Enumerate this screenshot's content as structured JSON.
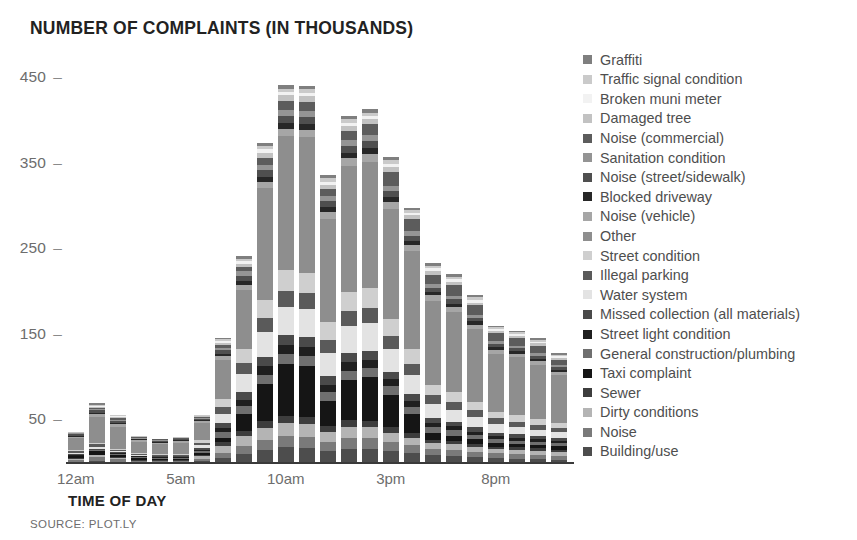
{
  "chart_data": {
    "type": "bar",
    "barmode": "stacked",
    "title": "NUMBER OF COMPLAINTS (IN THOUSANDS)",
    "xlabel": "TIME OF DAY",
    "ylabel": "",
    "source": "SOURCE: PLOT.LY",
    "ylim": [
      0,
      470
    ],
    "ytick_values": [
      50,
      150,
      250,
      350,
      450
    ],
    "ytick_labels": [
      "50",
      "150",
      "250",
      "350",
      "450"
    ],
    "xtick_labels": [
      "12am",
      "5am",
      "10am",
      "3pm",
      "8pm"
    ],
    "xtick_indices": [
      0,
      5,
      10,
      15,
      20
    ],
    "grid": false,
    "legend_position": "right",
    "categories": [
      "12am",
      "1am",
      "2am",
      "3am",
      "4am",
      "5am",
      "6am",
      "7am",
      "8am",
      "9am",
      "10am",
      "11am",
      "12pm",
      "1pm",
      "2pm",
      "3pm",
      "4pm",
      "5pm",
      "6pm",
      "7pm",
      "8pm",
      "9pm",
      "10pm",
      "11pm"
    ],
    "totals": [
      38,
      72,
      58,
      33,
      30,
      32,
      57,
      148,
      243,
      376,
      443,
      442,
      338,
      407,
      415,
      359,
      300,
      235,
      222,
      198,
      162,
      156,
      147,
      130
    ],
    "series": [
      {
        "name": "Building/use",
        "color": "#4d4d4d",
        "values": [
          2,
          3,
          2,
          1,
          1,
          1,
          3,
          7,
          12,
          17,
          20,
          19,
          15,
          18,
          18,
          16,
          13,
          10,
          9,
          8,
          7,
          6,
          6,
          5
        ]
      },
      {
        "name": "Noise",
        "color": "#7a7a7a",
        "values": [
          3,
          5,
          4,
          2,
          2,
          2,
          3,
          6,
          9,
          12,
          14,
          14,
          11,
          13,
          13,
          11,
          9,
          7,
          7,
          6,
          6,
          6,
          5,
          5
        ]
      },
      {
        "name": "Dirty conditions",
        "color": "#b4b4b4",
        "values": [
          1,
          2,
          1,
          1,
          1,
          1,
          3,
          8,
          12,
          14,
          15,
          15,
          12,
          13,
          13,
          11,
          9,
          7,
          7,
          6,
          5,
          5,
          5,
          4
        ]
      },
      {
        "name": "Sewer",
        "color": "#3d3d3d",
        "values": [
          1,
          1,
          1,
          1,
          1,
          1,
          2,
          5,
          7,
          8,
          9,
          9,
          7,
          8,
          8,
          7,
          6,
          4,
          4,
          4,
          3,
          3,
          3,
          3
        ]
      },
      {
        "name": "Taxi complaint",
        "color": "#151515",
        "values": [
          2,
          4,
          3,
          2,
          1,
          1,
          2,
          5,
          20,
          45,
          63,
          62,
          30,
          48,
          52,
          40,
          22,
          8,
          6,
          5,
          4,
          4,
          4,
          4
        ]
      },
      {
        "name": "General construction/plumbing",
        "color": "#6f6f6f",
        "values": [
          1,
          1,
          1,
          1,
          1,
          1,
          2,
          6,
          9,
          11,
          12,
          12,
          10,
          11,
          11,
          10,
          8,
          6,
          6,
          5,
          5,
          4,
          4,
          4
        ]
      },
      {
        "name": "Street light condition",
        "color": "#1f1f1f",
        "values": [
          1,
          1,
          1,
          1,
          1,
          1,
          2,
          5,
          8,
          10,
          11,
          11,
          9,
          10,
          10,
          9,
          7,
          5,
          5,
          4,
          4,
          4,
          3,
          3
        ]
      },
      {
        "name": "Missed collection (all materials)",
        "color": "#4a4a4a",
        "values": [
          1,
          1,
          1,
          1,
          1,
          1,
          2,
          6,
          9,
          11,
          12,
          12,
          10,
          11,
          11,
          9,
          8,
          6,
          5,
          5,
          4,
          4,
          4,
          3
        ]
      },
      {
        "name": "Water system",
        "color": "#e3e3e3",
        "values": [
          1,
          2,
          1,
          1,
          1,
          1,
          3,
          11,
          22,
          30,
          34,
          34,
          28,
          32,
          33,
          28,
          23,
          16,
          14,
          12,
          10,
          9,
          8,
          7
        ]
      },
      {
        "name": "Illegal parking",
        "color": "#5a5a5a",
        "values": [
          2,
          3,
          2,
          1,
          1,
          1,
          3,
          8,
          13,
          17,
          19,
          19,
          15,
          18,
          18,
          16,
          13,
          10,
          9,
          8,
          7,
          6,
          6,
          5
        ]
      },
      {
        "name": "Street condition",
        "color": "#cfcfcf",
        "values": [
          1,
          2,
          1,
          1,
          1,
          1,
          3,
          9,
          16,
          22,
          25,
          25,
          21,
          23,
          24,
          21,
          17,
          12,
          11,
          10,
          8,
          8,
          7,
          6
        ]
      },
      {
        "name": "Other",
        "color": "#8e8e8e",
        "values": [
          14,
          30,
          26,
          13,
          11,
          13,
          20,
          46,
          71,
          133,
          162,
          164,
          122,
          150,
          152,
          135,
          116,
          96,
          93,
          85,
          70,
          70,
          66,
          57
        ]
      },
      {
        "name": "Noise (vehicle)",
        "color": "#a6a6a6",
        "values": [
          2,
          4,
          3,
          2,
          2,
          2,
          2,
          4,
          6,
          8,
          9,
          9,
          8,
          9,
          9,
          8,
          7,
          6,
          6,
          5,
          5,
          4,
          4,
          4
        ]
      },
      {
        "name": "Blocked driveway",
        "color": "#272727",
        "values": [
          1,
          1,
          1,
          1,
          1,
          1,
          1,
          3,
          5,
          6,
          7,
          7,
          6,
          6,
          7,
          6,
          5,
          4,
          4,
          4,
          3,
          3,
          3,
          3
        ]
      },
      {
        "name": "Noise (street/sidewalk)",
        "color": "#4f4f4f",
        "values": [
          2,
          3,
          3,
          1,
          1,
          1,
          2,
          4,
          6,
          8,
          9,
          9,
          7,
          8,
          9,
          8,
          6,
          5,
          5,
          4,
          4,
          4,
          4,
          3
        ]
      },
      {
        "name": "Sanitation condition",
        "color": "#949494",
        "values": [
          1,
          1,
          1,
          1,
          1,
          1,
          1,
          3,
          5,
          6,
          7,
          7,
          6,
          7,
          7,
          6,
          5,
          4,
          4,
          4,
          3,
          3,
          3,
          3
        ]
      },
      {
        "name": "Noise (commercial)",
        "color": "#5c5c5c",
        "values": [
          1,
          2,
          2,
          1,
          1,
          1,
          1,
          3,
          5,
          9,
          11,
          11,
          8,
          11,
          13,
          17,
          14,
          11,
          12,
          11,
          10,
          9,
          9,
          6
        ]
      },
      {
        "name": "Damaged tree",
        "color": "#c2c2c2",
        "values": [
          1,
          1,
          1,
          1,
          1,
          1,
          1,
          3,
          4,
          6,
          7,
          7,
          5,
          6,
          6,
          6,
          5,
          4,
          4,
          3,
          3,
          3,
          3,
          2
        ]
      },
      {
        "name": "Broken muni meter",
        "color": "#f2f2f2",
        "values": [
          0,
          1,
          1,
          0,
          0,
          0,
          0,
          2,
          3,
          4,
          4,
          4,
          4,
          4,
          4,
          4,
          3,
          3,
          3,
          3,
          2,
          2,
          2,
          2
        ]
      },
      {
        "name": "Traffic signal condition",
        "color": "#cacaca",
        "values": [
          0,
          1,
          1,
          0,
          0,
          0,
          1,
          2,
          3,
          4,
          4,
          4,
          4,
          4,
          4,
          4,
          3,
          3,
          3,
          3,
          2,
          2,
          2,
          2
        ]
      },
      {
        "name": "Graffiti",
        "color": "#7f7f7f",
        "values": [
          0,
          3,
          1,
          0,
          0,
          0,
          0,
          2,
          3,
          4,
          4,
          4,
          4,
          4,
          4,
          4,
          3,
          3,
          3,
          3,
          2,
          2,
          2,
          2
        ]
      }
    ]
  },
  "legend": {
    "items": [
      {
        "label": "Graffiti",
        "color": "#7f7f7f"
      },
      {
        "label": "Traffic signal condition",
        "color": "#cacaca"
      },
      {
        "label": "Broken muni meter",
        "color": "#f2f2f2"
      },
      {
        "label": "Damaged tree",
        "color": "#c2c2c2"
      },
      {
        "label": "Noise (commercial)",
        "color": "#5c5c5c"
      },
      {
        "label": "Sanitation condition",
        "color": "#949494"
      },
      {
        "label": "Noise (street/sidewalk)",
        "color": "#4f4f4f"
      },
      {
        "label": "Blocked driveway",
        "color": "#272727"
      },
      {
        "label": "Noise (vehicle)",
        "color": "#a6a6a6"
      },
      {
        "label": "Other",
        "color": "#8e8e8e"
      },
      {
        "label": "Street condition",
        "color": "#cfcfcf"
      },
      {
        "label": "Illegal parking",
        "color": "#5a5a5a"
      },
      {
        "label": "Water system",
        "color": "#e3e3e3"
      },
      {
        "label": "Missed collection (all materials)",
        "color": "#4a4a4a"
      },
      {
        "label": "Street light condition",
        "color": "#1f1f1f"
      },
      {
        "label": "General construction/plumbing",
        "color": "#6f6f6f"
      },
      {
        "label": "Taxi complaint",
        "color": "#151515"
      },
      {
        "label": "Sewer",
        "color": "#3d3d3d"
      },
      {
        "label": "Dirty conditions",
        "color": "#b4b4b4"
      },
      {
        "label": "Noise",
        "color": "#7a7a7a"
      },
      {
        "label": "Building/use",
        "color": "#4d4d4d"
      }
    ]
  }
}
